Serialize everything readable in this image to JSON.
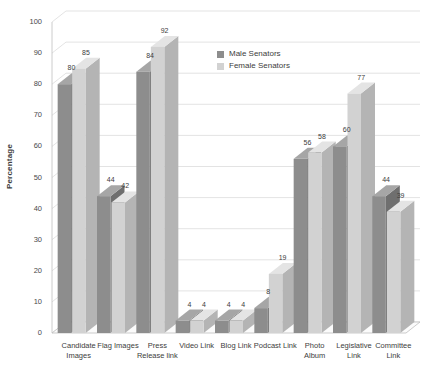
{
  "chart_data": {
    "type": "bar",
    "title": "",
    "subtitle": "",
    "xlabel": "",
    "ylabel": "Percentage",
    "ylim": [
      0,
      100
    ],
    "ytick_step": 10,
    "yticks": [
      0,
      10,
      20,
      30,
      40,
      50,
      60,
      70,
      80,
      90,
      100
    ],
    "grid": true,
    "legend_position": "inside-top-center",
    "style": "3d-column",
    "categories": [
      "Candidate Images",
      "Flag Images",
      "Press Release link",
      "Video Link",
      "Blog Link",
      "Podcast Link",
      "Photo Album",
      "Legislative Link",
      "Committee Link"
    ],
    "category_lines": [
      "Candidate\nImages",
      "Flag Images",
      "Press\nRelease link",
      "Video Link",
      "Blog Link",
      "Podcast Link",
      "Photo\nAlbum",
      "Legislative\nLink",
      "Committee\nLink"
    ],
    "series": [
      {
        "name": "Male Senators",
        "color": "#8d8d8d",
        "values": [
          80,
          44,
          84,
          4,
          4,
          8,
          56,
          60,
          44
        ]
      },
      {
        "name": "Female Senators",
        "color": "#d2d2d2",
        "values": [
          85,
          42,
          92,
          4,
          4,
          19,
          58,
          77,
          39
        ]
      }
    ]
  },
  "colors": {
    "background": "#ffffff",
    "male_bar": "#8d8d8d",
    "male_bar_top": "#a6a6a6",
    "male_bar_side": "#6f6f6f",
    "female_bar": "#d2d2d2",
    "female_bar_top": "#e4e4e4",
    "female_bar_side": "#b4b4b4",
    "gridline": "#dcdcdc",
    "axis": "#bfbfbf",
    "text": "#3d3d3d"
  },
  "legend": {
    "items": [
      {
        "label": "Male Senators",
        "color": "#8d8d8d"
      },
      {
        "label": "Female Senators",
        "color": "#d2d2d2"
      }
    ]
  },
  "axis": {
    "y_title": "Percentage",
    "y_tick_labels": [
      "0",
      "10",
      "20",
      "30",
      "40",
      "50",
      "60",
      "70",
      "80",
      "90",
      "100"
    ]
  }
}
